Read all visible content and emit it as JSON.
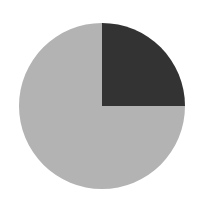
{
  "chart_data": {
    "type": "pie",
    "title": "",
    "categories": [
      "Dark slice",
      "Light slice"
    ],
    "values": [
      25,
      75
    ],
    "colors": [
      "#333333",
      "#b3b3b3"
    ],
    "start_angle_deg": 90,
    "direction": "clockwise",
    "legend": "none",
    "labels_visible": false
  },
  "geometry": {
    "cx": 102,
    "cy": 106,
    "r": 83
  }
}
